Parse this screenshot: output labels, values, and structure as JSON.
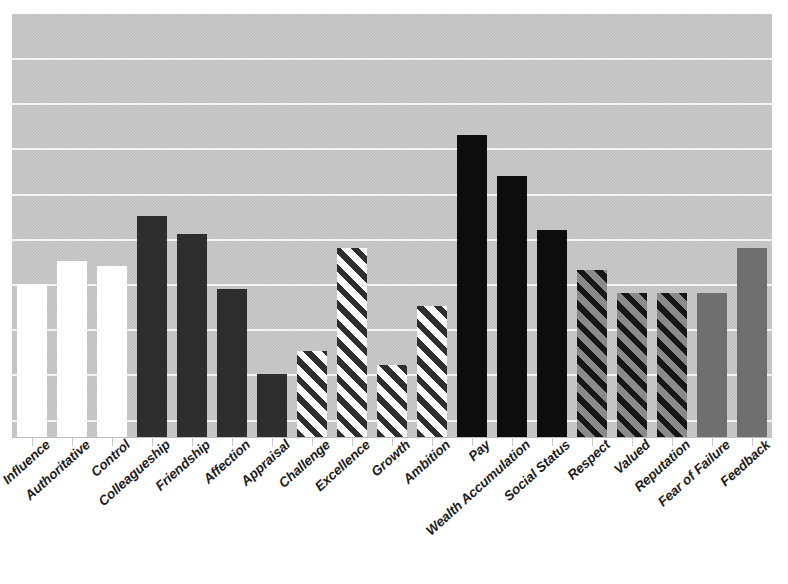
{
  "title": "",
  "chart_data": {
    "type": "bar",
    "title": "",
    "xlabel": "",
    "ylabel": "",
    "grid": true,
    "legend": "none",
    "ylim": [
      0,
      9.4
    ],
    "gridline_count": 9,
    "categories": [
      "Influence",
      "Authoritative",
      "Control",
      "Colleagueship",
      "Friendship",
      "Affection",
      "Appraisal",
      "Challenge",
      "Excellence",
      "Growth",
      "Ambition",
      "Pay",
      "Wealth Accumulation",
      "Social Status",
      "Respect",
      "Valued",
      "Reputation",
      "Fear of Failure",
      "Feedback"
    ],
    "values": [
      3.4,
      3.9,
      3.8,
      4.9,
      4.5,
      3.3,
      1.4,
      1.9,
      4.2,
      1.6,
      2.9,
      6.7,
      5.8,
      4.6,
      3.7,
      3.2,
      3.2,
      3.2,
      4.2
    ],
    "bar_styles": [
      "white",
      "white",
      "white",
      "dark",
      "dark",
      "dark",
      "dark",
      "hatch-white",
      "hatch-white",
      "hatch-white",
      "hatch-white",
      "black",
      "black",
      "black",
      "hatch-gray",
      "hatch-gray",
      "hatch-gray",
      "gray",
      "gray"
    ],
    "colors": {
      "plot_background": "#c6c6c6",
      "gridline": "#f4f4f4",
      "bar_white": "#ffffff",
      "bar_dark": "#2e2e2e",
      "bar_black": "#0d0d0d",
      "bar_gray": "#6f6f6f",
      "hatch_light_stripe": "#ffffff",
      "hatch_gray_stripe": "#8a8a8a",
      "hatch_dark_stripe": "#161616",
      "label_text": "#1b1b1b"
    }
  }
}
